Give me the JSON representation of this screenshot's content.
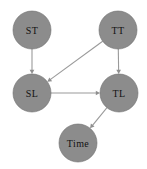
{
  "figure": {
    "type": "directed-graph",
    "width": 147,
    "height": 169,
    "background_color": "#ffffff"
  },
  "style": {
    "node_fill": "#8c8c8c",
    "node_stroke": "#6e6e6e",
    "node_radius": 19,
    "node_label_color": "#121212",
    "node_label_size": 10,
    "edge_color": "#9a9a9a",
    "edge_width": 1.1,
    "arrow_color": "#8f8f8f",
    "arrow_size": 4.2
  },
  "graph": {
    "nodes": [
      {
        "id": "ST",
        "label": "ST",
        "cx": 32,
        "cy": 30,
        "r": 19,
        "label_size": 10
      },
      {
        "id": "TT",
        "label": "TT",
        "cx": 118,
        "cy": 30,
        "r": 19,
        "label_size": 10
      },
      {
        "id": "SL",
        "label": "SL",
        "cx": 32,
        "cy": 93,
        "r": 19,
        "label_size": 10
      },
      {
        "id": "TL",
        "label": "TL",
        "cx": 119,
        "cy": 93,
        "r": 19,
        "label_size": 10
      },
      {
        "id": "Time",
        "label": "Time",
        "cx": 78,
        "cy": 143,
        "r": 19,
        "label_size": 10
      }
    ],
    "edges": [
      {
        "id": "ST-SL",
        "from": "ST",
        "to": "SL",
        "directed": true,
        "arrow_at": "target"
      },
      {
        "id": "TT-TL",
        "from": "TT",
        "to": "TL",
        "directed": true,
        "arrow_at": "target"
      },
      {
        "id": "TT-SL",
        "from": "TT",
        "to": "SL",
        "directed": true,
        "arrow_at": "target"
      },
      {
        "id": "SL-TL",
        "from": "SL",
        "to": "TL",
        "directed": true,
        "arrow_at": "target"
      },
      {
        "id": "TL-Time",
        "from": "TL",
        "to": "Time",
        "directed": true,
        "arrow_at": "target"
      }
    ]
  }
}
